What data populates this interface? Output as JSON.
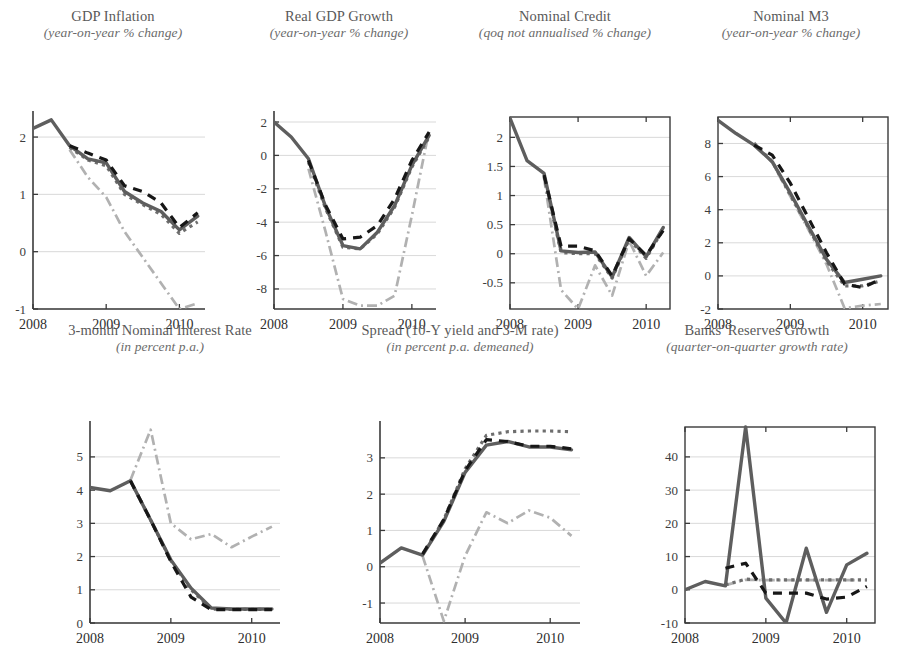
{
  "figure": {
    "width": 904,
    "height": 624,
    "background": "#ffffff",
    "series_styles": {
      "actual": "#5e5e5e",
      "dashed_black": "#171717",
      "dotted_gray": "#6e6e6e",
      "dashdot_light": "#b1b1b1"
    }
  },
  "chart_data": [
    {
      "id": "gdp-inflation",
      "type": "line",
      "title": "GDP Inflation",
      "subtitle": "(year-on-year % change)",
      "xlabel": "",
      "ylabel": "",
      "xlim": [
        2008.0,
        2010.35
      ],
      "ylim": [
        -1.0,
        2.35
      ],
      "xticks": [
        2008,
        2009,
        2010
      ],
      "xticklabels": [
        "2008",
        "2009",
        "2010"
      ],
      "yticks": [
        -1,
        0,
        1,
        2
      ],
      "yticklabels": [
        "-1",
        "0",
        "1",
        "2"
      ],
      "grid": true,
      "x": [
        2008.0,
        2008.25,
        2008.5,
        2008.75,
        2009.0,
        2009.25,
        2009.5,
        2009.75,
        2010.0,
        2010.25
      ],
      "series": [
        {
          "name": "actual",
          "style": "actual",
          "values": [
            2.15,
            2.3,
            1.85,
            1.62,
            1.55,
            1.05,
            0.85,
            0.7,
            0.38,
            0.62
          ]
        },
        {
          "name": "model-dashed",
          "style": "dashed_black",
          "values": [
            null,
            null,
            1.85,
            1.72,
            1.6,
            1.15,
            1.05,
            0.85,
            0.42,
            0.68
          ]
        },
        {
          "name": "model-dotted",
          "style": "dotted_gray",
          "values": [
            null,
            null,
            1.82,
            1.6,
            1.5,
            1.0,
            0.82,
            0.65,
            0.32,
            0.52
          ]
        },
        {
          "name": "counterfactual",
          "style": "dashdot_light",
          "values": [
            null,
            null,
            1.78,
            1.3,
            0.95,
            0.35,
            -0.1,
            -0.55,
            -1.0,
            -0.9
          ]
        }
      ]
    },
    {
      "id": "real-gdp-growth",
      "type": "line",
      "title": "Real GDP Growth",
      "subtitle": "(year-on-year % change)",
      "xlim": [
        2008.0,
        2010.35
      ],
      "ylim": [
        -9.2,
        2.3
      ],
      "xticks": [
        2008,
        2009,
        2010
      ],
      "xticklabels": [
        "2008",
        "2009",
        "2010"
      ],
      "yticks": [
        -8,
        -6,
        -4,
        -2,
        0,
        2
      ],
      "yticklabels": [
        "-8",
        "-6",
        "-4",
        "-2",
        "0",
        "2"
      ],
      "grid": true,
      "x": [
        2008.0,
        2008.25,
        2008.5,
        2008.75,
        2009.0,
        2009.25,
        2009.5,
        2009.75,
        2010.0,
        2010.25
      ],
      "series": [
        {
          "name": "actual",
          "style": "actual",
          "values": [
            2.0,
            1.1,
            -0.2,
            -3.1,
            -5.4,
            -5.6,
            -4.6,
            -3.0,
            -0.6,
            1.2
          ]
        },
        {
          "name": "model-dashed",
          "style": "dashed_black",
          "values": [
            null,
            null,
            -0.3,
            -3.0,
            -5.0,
            -4.9,
            -4.2,
            -2.6,
            -0.3,
            1.4
          ]
        },
        {
          "name": "model-dotted",
          "style": "dotted_gray",
          "values": [
            null,
            null,
            -0.4,
            -3.2,
            -5.5,
            -5.6,
            -4.7,
            -3.1,
            -0.7,
            1.1
          ]
        },
        {
          "name": "counterfactual",
          "style": "dashdot_light",
          "values": [
            null,
            null,
            -0.8,
            -4.6,
            -8.6,
            -9.0,
            -9.0,
            -8.4,
            -3.6,
            1.5
          ]
        }
      ]
    },
    {
      "id": "nominal-credit",
      "type": "line",
      "title": "Nominal Credit",
      "subtitle": "(qoq not annualised % change)",
      "xlim": [
        2008.0,
        2010.35
      ],
      "ylim": [
        -0.95,
        2.35
      ],
      "xticks": [
        2008,
        2009,
        2010
      ],
      "xticklabels": [
        "2008",
        "2009",
        "2010"
      ],
      "yticks": [
        -0.5,
        0,
        0.5,
        1,
        1.5,
        2
      ],
      "yticklabels": [
        "-0.5",
        "0",
        "0.5",
        "1",
        "1.5",
        "2"
      ],
      "grid": true,
      "x": [
        2008.0,
        2008.25,
        2008.5,
        2008.75,
        2009.0,
        2009.25,
        2009.5,
        2009.75,
        2010.0,
        2010.25
      ],
      "series": [
        {
          "name": "actual",
          "style": "actual",
          "values": [
            2.33,
            1.6,
            1.38,
            0.05,
            0.02,
            0.03,
            -0.4,
            0.28,
            -0.05,
            0.45
          ]
        },
        {
          "name": "model-dashed",
          "style": "dashed_black",
          "values": [
            null,
            null,
            1.35,
            0.13,
            0.13,
            0.05,
            -0.38,
            0.26,
            -0.03,
            0.4
          ]
        },
        {
          "name": "model-dotted",
          "style": "dotted_gray",
          "values": [
            null,
            null,
            1.33,
            0.02,
            0.0,
            0.0,
            -0.42,
            0.25,
            -0.08,
            0.42
          ]
        },
        {
          "name": "counterfactual",
          "style": "dashdot_light",
          "values": [
            null,
            null,
            1.3,
            -0.62,
            -0.95,
            -0.2,
            -0.72,
            0.22,
            -0.38,
            0.02
          ]
        }
      ]
    },
    {
      "id": "nominal-m3",
      "type": "line",
      "title": "Nominal M3",
      "subtitle": "(year-on-year % change)",
      "xlim": [
        2008.0,
        2010.35
      ],
      "ylim": [
        -2.0,
        9.6
      ],
      "xticks": [
        2008,
        2009,
        2010
      ],
      "xticklabels": [
        "2008",
        "2009",
        "2010"
      ],
      "yticks": [
        -2,
        0,
        2,
        4,
        6,
        8
      ],
      "yticklabels": [
        "-2",
        "0",
        "2",
        "4",
        "6",
        "8"
      ],
      "grid": true,
      "x": [
        2008.0,
        2008.25,
        2008.5,
        2008.75,
        2009.0,
        2009.25,
        2009.5,
        2009.75,
        2010.0,
        2010.25
      ],
      "series": [
        {
          "name": "actual",
          "style": "actual",
          "values": [
            9.4,
            8.6,
            7.9,
            6.9,
            5.0,
            3.0,
            1.0,
            -0.4,
            -0.2,
            0.0
          ]
        },
        {
          "name": "model-dashed",
          "style": "dashed_black",
          "values": [
            null,
            null,
            7.9,
            7.3,
            5.6,
            3.5,
            1.4,
            -0.5,
            -0.7,
            -0.2
          ]
        },
        {
          "name": "model-dotted",
          "style": "dotted_gray",
          "values": [
            null,
            null,
            8.0,
            6.9,
            4.9,
            2.9,
            0.9,
            -0.6,
            -0.6,
            -0.3
          ]
        },
        {
          "name": "counterfactual",
          "style": "dashdot_light",
          "values": [
            null,
            null,
            8.05,
            6.85,
            4.8,
            2.8,
            0.7,
            -1.95,
            -1.8,
            -1.7
          ]
        }
      ]
    },
    {
      "id": "three-month-nominal-interest-rate",
      "type": "line",
      "title": "3-month Nominal Interest Rate",
      "subtitle": "(in percent p.a.)",
      "xlim": [
        2008.0,
        2010.35
      ],
      "ylim": [
        0,
        5.9
      ],
      "xticks": [
        2008,
        2009,
        2010
      ],
      "xticklabels": [
        "2008",
        "2009",
        "2010"
      ],
      "yticks": [
        0,
        1,
        2,
        3,
        4,
        5
      ],
      "yticklabels": [
        "0",
        "1",
        "2",
        "3",
        "4",
        "5"
      ],
      "grid": true,
      "x": [
        2008.0,
        2008.25,
        2008.5,
        2008.75,
        2009.0,
        2009.25,
        2009.5,
        2009.75,
        2010.0,
        2010.25
      ],
      "series": [
        {
          "name": "actual",
          "style": "actual",
          "values": [
            4.08,
            3.98,
            4.28,
            3.1,
            1.9,
            1.05,
            0.45,
            0.42,
            0.42,
            0.42
          ]
        },
        {
          "name": "model-dashed",
          "style": "dashed_black",
          "values": [
            null,
            null,
            4.28,
            3.1,
            1.85,
            0.78,
            0.4,
            0.4,
            0.4,
            0.4
          ]
        },
        {
          "name": "model-dotted",
          "style": "dotted_gray",
          "values": [
            null,
            null,
            4.28,
            3.1,
            1.88,
            1.0,
            0.42,
            0.41,
            0.41,
            0.41
          ]
        },
        {
          "name": "counterfactual",
          "style": "dashdot_light",
          "values": [
            null,
            null,
            4.3,
            5.82,
            3.0,
            2.52,
            2.68,
            2.28,
            2.6,
            2.9
          ]
        }
      ]
    },
    {
      "id": "spread",
      "type": "line",
      "title": "Spread (10-Y yield and 3-M rate)",
      "subtitle": "(in percent p.a. demeaned)",
      "xlim": [
        2008.0,
        2010.35
      ],
      "ylim": [
        -1.55,
        3.85
      ],
      "xticks": [
        2008,
        2009,
        2010
      ],
      "xticklabels": [
        "2008",
        "2009",
        "2010"
      ],
      "yticks": [
        -1,
        0,
        1,
        2,
        3
      ],
      "yticklabels": [
        "-1",
        "0",
        "1",
        "2",
        "3"
      ],
      "grid": true,
      "x": [
        2008.0,
        2008.25,
        2008.5,
        2008.75,
        2009.0,
        2009.25,
        2009.5,
        2009.75,
        2010.0,
        2010.25
      ],
      "series": [
        {
          "name": "actual",
          "style": "actual",
          "values": [
            0.1,
            0.52,
            0.32,
            1.25,
            2.6,
            3.35,
            3.45,
            3.3,
            3.3,
            3.22
          ]
        },
        {
          "name": "model-dashed",
          "style": "dashed_black",
          "values": [
            null,
            null,
            0.35,
            1.3,
            2.65,
            3.5,
            3.45,
            3.32,
            3.32,
            3.25
          ]
        },
        {
          "name": "model-dotted",
          "style": "dotted_gray",
          "values": [
            null,
            null,
            0.33,
            1.3,
            2.7,
            3.62,
            3.72,
            3.74,
            3.74,
            3.72
          ]
        },
        {
          "name": "counterfactual",
          "style": "dashdot_light",
          "values": [
            null,
            null,
            0.3,
            -1.5,
            0.3,
            1.5,
            1.2,
            1.55,
            1.35,
            0.85
          ]
        }
      ]
    },
    {
      "id": "banks-reserves-growth",
      "type": "line",
      "title": "Banks' Reserves Growth",
      "subtitle": "(quarter-on-quarter growth rate)",
      "xlim": [
        2008.0,
        2010.35
      ],
      "ylim": [
        -10,
        49
      ],
      "xticks": [
        2008,
        2009,
        2010
      ],
      "xticklabels": [
        "2008",
        "2009",
        "2010"
      ],
      "yticks": [
        -10,
        0,
        10,
        20,
        30,
        40
      ],
      "yticklabels": [
        "-10",
        "0",
        "10",
        "20",
        "30",
        "40"
      ],
      "grid": true,
      "x": [
        2008.0,
        2008.25,
        2008.5,
        2008.75,
        2009.0,
        2009.25,
        2009.5,
        2009.75,
        2010.0,
        2010.25
      ],
      "series": [
        {
          "name": "actual",
          "style": "actual",
          "values": [
            0.0,
            2.5,
            1.2,
            49.0,
            -2.5,
            -10.0,
            12.5,
            -6.8,
            7.5,
            11.0
          ]
        },
        {
          "name": "model-dashed",
          "style": "dashed_black",
          "values": [
            null,
            null,
            6.5,
            8.0,
            -1.0,
            -1.0,
            -1.0,
            -2.8,
            -2.2,
            1.0
          ]
        },
        {
          "name": "model-dotted",
          "style": "dotted_gray",
          "values": [
            null,
            null,
            1.5,
            3.2,
            3.0,
            3.0,
            3.0,
            3.0,
            3.0,
            3.0
          ]
        },
        {
          "name": "counterfactual",
          "style": "dashdot_light",
          "values": [
            null,
            null,
            1.4,
            3.0,
            2.9,
            2.9,
            2.9,
            2.9,
            2.9,
            2.9
          ]
        }
      ]
    }
  ]
}
